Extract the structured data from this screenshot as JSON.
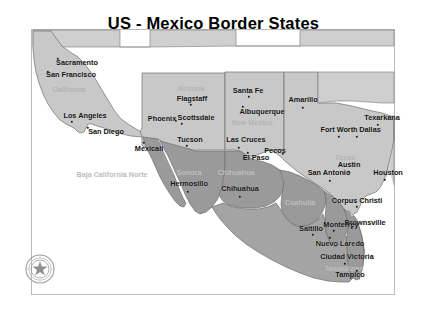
{
  "title": "US - Mexico Border States",
  "colors": {
    "us_state_fill": "#c8c8c8",
    "mx_state_fill": "#9a9a9a",
    "water_fill": "#ffffff",
    "border_stroke": "#6e6e6e",
    "frame_stroke": "#b9b9b9",
    "city_label": "#111111",
    "state_label": "#b3b3b3",
    "title_color": "#000000"
  },
  "seal": {
    "name": "texas-state-seal",
    "star_points": 5
  },
  "us_states": [
    {
      "name": "California",
      "label": "California",
      "x": 69,
      "y": 89
    },
    {
      "name": "Arizona",
      "label": "Arizona",
      "x": 191,
      "y": 88
    },
    {
      "name": "New Mexico",
      "label": "New Mexico",
      "x": 252,
      "y": 122
    },
    {
      "name": "Texas",
      "label": "Texas",
      "x": 345,
      "y": 157
    }
  ],
  "mx_states": [
    {
      "name": "Baja California Norte",
      "label": "Baja California Norte",
      "x": 112,
      "y": 174
    },
    {
      "name": "Sonora",
      "label": "Sonora",
      "x": 189,
      "y": 172
    },
    {
      "name": "Chihuahua",
      "label": "Chihuahua",
      "x": 236,
      "y": 172
    },
    {
      "name": "Coahuila",
      "label": "Coahuila",
      "x": 300,
      "y": 202
    },
    {
      "name": "Nuevo Leon",
      "label": "Nuevo Leon",
      "x": 337,
      "y": 243
    },
    {
      "name": "Tamaulipas",
      "label": "Tamaulipas",
      "x": 344,
      "y": 268
    }
  ],
  "cities": [
    {
      "label": "Sacramento",
      "lx": 77,
      "ly": 62,
      "dx": 58,
      "dy": 59
    },
    {
      "label": "San Francisco",
      "lx": 71,
      "ly": 74,
      "dx": 48,
      "dy": 72
    },
    {
      "label": "Los Angeles",
      "lx": 85,
      "ly": 115,
      "dx": 72,
      "dy": 122
    },
    {
      "label": "San Diego",
      "lx": 106,
      "ly": 131,
      "dx": 88,
      "dy": 128
    },
    {
      "label": "Flagstaff",
      "lx": 192,
      "ly": 98,
      "dx": 191,
      "dy": 105
    },
    {
      "label": "Phoenix",
      "lx": 162,
      "ly": 118,
      "dx": 176,
      "dy": 121
    },
    {
      "label": "Scottsdale",
      "lx": 196,
      "ly": 117,
      "dx": 182,
      "dy": 124
    },
    {
      "label": "Tucson",
      "lx": 190,
      "ly": 139,
      "dx": 187,
      "dy": 146
    },
    {
      "label": "Santa Fe",
      "lx": 248,
      "ly": 90,
      "dx": 249,
      "dy": 97
    },
    {
      "label": "Albuquerque",
      "lx": 262,
      "ly": 111,
      "dx": 243,
      "dy": 107
    },
    {
      "label": "Las Cruces",
      "lx": 246,
      "ly": 139,
      "dx": 239,
      "dy": 148
    },
    {
      "label": "El Paso",
      "lx": 256,
      "ly": 157,
      "dx": 248,
      "dy": 153
    },
    {
      "label": "Pecos",
      "lx": 275,
      "ly": 150,
      "dx": 283,
      "dy": 154
    },
    {
      "label": "Amarillo",
      "lx": 303,
      "ly": 99,
      "dx": 303,
      "dy": 108
    },
    {
      "label": "Texarkana",
      "lx": 382,
      "ly": 117,
      "dx": 378,
      "dy": 125
    },
    {
      "label": "Fort Worth",
      "lx": 339,
      "ly": 129,
      "dx": 339,
      "dy": 137
    },
    {
      "label": "Dallas",
      "lx": 370,
      "ly": 129,
      "dx": 357,
      "dy": 137
    },
    {
      "label": "Austin",
      "lx": 349,
      "ly": 164,
      "dx": 349,
      "dy": 172
    },
    {
      "label": "Houston",
      "lx": 388,
      "ly": 172,
      "dx": 385,
      "dy": 180
    },
    {
      "label": "San Antonio",
      "lx": 329,
      "ly": 172,
      "dx": 330,
      "dy": 181
    },
    {
      "label": "Corpus Christi",
      "lx": 357,
      "ly": 200,
      "dx": 357,
      "dy": 207
    },
    {
      "label": "Brownsville",
      "lx": 365,
      "ly": 222,
      "dx": 352,
      "dy": 228
    },
    {
      "label": "Monterrey",
      "lx": 341,
      "ly": 224,
      "dx": 334,
      "dy": 231
    },
    {
      "label": "Saltillo",
      "lx": 311,
      "ly": 228,
      "dx": 313,
      "dy": 235
    },
    {
      "label": "Nuevo Laredo",
      "lx": 340,
      "ly": 243,
      "dx": 330,
      "dy": 238
    },
    {
      "label": "Ciudad Victoria",
      "lx": 347,
      "ly": 256,
      "dx": 345,
      "dy": 264
    },
    {
      "label": "Tampico",
      "lx": 350,
      "ly": 274,
      "dx": 357,
      "dy": 271
    },
    {
      "label": "Hermosillo",
      "lx": 189,
      "ly": 183,
      "dx": 188,
      "dy": 192
    },
    {
      "label": "Chihuahua",
      "lx": 240,
      "ly": 188,
      "dx": 240,
      "dy": 197
    },
    {
      "label": "Mexicali",
      "lx": 149,
      "ly": 148,
      "dx": 144,
      "dy": 143
    }
  ]
}
